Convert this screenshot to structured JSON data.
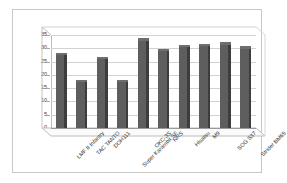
{
  "chart_data": {
    "type": "bar",
    "title": "",
    "xlabel": "",
    "ylabel": "",
    "ylim": [
      0,
      35
    ],
    "ytick_step": 5,
    "yticks": [
      "35",
      "30",
      "25",
      "20",
      "15",
      "10",
      "5",
      "0"
    ],
    "grid": true,
    "legend": "none",
    "style": "3d-column",
    "bar_color": "#5e5e5e",
    "plot_background": "#ffffff",
    "gridline_color": "#d2d2d2",
    "border_color": "#c8c8c8",
    "categories": [
      "LMF II Infantry",
      "TAC TANTO",
      "DOH111",
      "Super Karambit SF",
      "OKC-3S",
      "NRS",
      "Hisatsu",
      "M9",
      "SOG S37",
      "Strider BM65"
    ],
    "values": [
      27.5,
      17.5,
      26,
      17.5,
      33,
      29,
      30.5,
      31,
      31.5,
      30
    ]
  }
}
